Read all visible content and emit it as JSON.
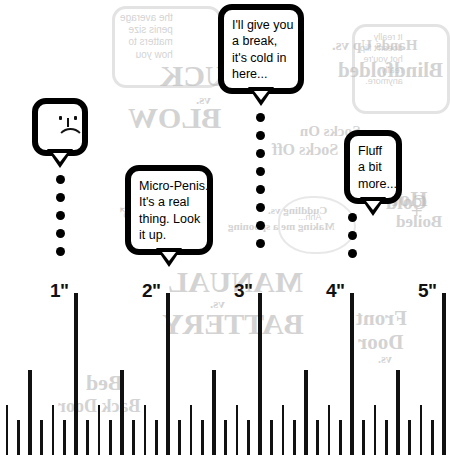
{
  "meta": {
    "background_color": "#ffffff",
    "ink_color": "#000000",
    "ghost_color": "#b9b9b9"
  },
  "ruler": {
    "unit_symbol": "\"",
    "inch_labels": [
      "1\"",
      "2\"",
      "3\"",
      "4\"",
      "5\""
    ],
    "inch_positions_px": [
      76,
      168,
      260,
      352,
      444
    ],
    "pixels_per_inch": 92,
    "subdivision": "eighths",
    "tick_heights_px": {
      "inch": 162,
      "half": 85,
      "quarter": 50,
      "eighth": 35
    }
  },
  "callouts": [
    {
      "name": "one-inch-callout",
      "anchor_label": "1\"",
      "icon": "sad-face-icon",
      "lines": [],
      "dot_count": 5
    },
    {
      "name": "two-inch-callout",
      "anchor_label": "2\"",
      "icon": null,
      "lines": [
        "Micro-Penis.",
        "It's a real",
        "thing. Look",
        "it up."
      ],
      "dot_count": 0
    },
    {
      "name": "three-inch-callout",
      "anchor_label": "3\"",
      "icon": null,
      "lines": [
        "I'll give you",
        "a break,",
        "it's cold in",
        "here..."
      ],
      "dot_count": 8
    },
    {
      "name": "four-inch-callout",
      "anchor_label": "4\"",
      "icon": null,
      "lines": [
        "Fluff",
        "a bit",
        "more..."
      ],
      "dot_count": 3
    }
  ],
  "ghost_text": {
    "note": "mirrored show-through from the reverse side of the printed page",
    "items": [
      {
        "name": "ghost-bubble-top-text",
        "text": "the average\npenis size\nmatters to\nhow you",
        "x": 120,
        "y": 12,
        "size": 10,
        "serif": false
      },
      {
        "name": "ghost-headline-suck",
        "text": "SUCK",
        "x": 160,
        "y": 58,
        "size": 30,
        "serif": true
      },
      {
        "name": "ghost-headline-vs-1",
        "text": "vs.",
        "x": 196,
        "y": 92,
        "size": 13,
        "serif": true
      },
      {
        "name": "ghost-headline-blow",
        "text": "BLOW",
        "x": 128,
        "y": 100,
        "size": 30,
        "serif": true
      },
      {
        "name": "ghost-heading-socks-on",
        "text": "Socks On",
        "x": 300,
        "y": 122,
        "size": 15,
        "serif": true
      },
      {
        "name": "ghost-heading-socks-off",
        "text": "Socks Off",
        "x": 272,
        "y": 140,
        "size": 16,
        "serif": true
      },
      {
        "name": "ghost-heading-hands-up",
        "text": "Hands Up vs.",
        "x": 332,
        "y": 36,
        "size": 15,
        "serif": true
      },
      {
        "name": "ghost-heading-blindfolded",
        "text": "Blindfolded",
        "x": 338,
        "y": 58,
        "size": 21,
        "serif": true
      },
      {
        "name": "ghost-bubble-right-text",
        "text": "It really\ndoesn't flip\nhot you're\nreally\nanymore.",
        "x": 360,
        "y": 32,
        "size": 9,
        "serif": false
      },
      {
        "name": "ghost-heading-hot",
        "text": "Hot",
        "x": 392,
        "y": 186,
        "size": 22,
        "serif": true
      },
      {
        "name": "ghost-heading-cold",
        "text": "Cold",
        "x": 386,
        "y": 190,
        "size": 20,
        "serif": true
      },
      {
        "name": "ghost-heading-boiled",
        "text": "Boiled",
        "x": 396,
        "y": 212,
        "size": 17,
        "serif": true
      },
      {
        "name": "ghost-heading-cuddling",
        "text": "Cuddling vs.",
        "x": 268,
        "y": 204,
        "size": 11,
        "serif": true
      },
      {
        "name": "ghost-heading-spooning",
        "text": "Making me a spooning",
        "x": 228,
        "y": 220,
        "size": 11,
        "serif": true
      },
      {
        "name": "ghost-bubble-mid-text",
        "text": "Ahh...",
        "x": 298,
        "y": 212,
        "size": 9,
        "serif": false
      },
      {
        "name": "ghost-headline-manual",
        "text": "MANUAL",
        "x": 168,
        "y": 264,
        "size": 30,
        "serif": true
      },
      {
        "name": "ghost-headline-vs-2",
        "text": "vs.",
        "x": 210,
        "y": 296,
        "size": 13,
        "serif": true
      },
      {
        "name": "ghost-headline-battery",
        "text": "BATTERY",
        "x": 162,
        "y": 306,
        "size": 30,
        "serif": true
      },
      {
        "name": "ghost-heading-front",
        "text": "Front",
        "x": 356,
        "y": 306,
        "size": 21,
        "serif": true
      },
      {
        "name": "ghost-heading-door",
        "text": "Door",
        "x": 358,
        "y": 330,
        "size": 21,
        "serif": true
      },
      {
        "name": "ghost-heading-vs-3",
        "text": "vs.",
        "x": 378,
        "y": 352,
        "size": 12,
        "serif": true
      },
      {
        "name": "ghost-heading-bed",
        "text": "Bed",
        "x": 86,
        "y": 370,
        "size": 22,
        "serif": true
      },
      {
        "name": "ghost-heading-back",
        "text": "Back Door",
        "x": 58,
        "y": 396,
        "size": 18,
        "serif": true
      },
      {
        "name": "ghost-symbol-venus",
        "text": "♀",
        "x": 404,
        "y": 186,
        "size": 34
      },
      {
        "name": "ghost-symbol-mars",
        "text": "♂",
        "x": 116,
        "y": 198,
        "size": 26
      }
    ]
  }
}
